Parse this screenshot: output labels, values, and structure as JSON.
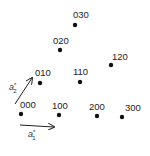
{
  "diagram": {
    "type": "reciprocal-lattice",
    "points": [
      {
        "label": "000",
        "x": 21,
        "y": 114,
        "lx": 20,
        "ly": 108
      },
      {
        "label": "100",
        "x": 59,
        "y": 115,
        "lx": 52,
        "ly": 109
      },
      {
        "label": "200",
        "x": 97,
        "y": 116,
        "lx": 89,
        "ly": 110
      },
      {
        "label": "300",
        "x": 122,
        "y": 117,
        "lx": 125,
        "ly": 111
      },
      {
        "label": "010",
        "x": 40,
        "y": 83,
        "lx": 35,
        "ly": 76
      },
      {
        "label": "110",
        "x": 80,
        "y": 82,
        "lx": 73,
        "ly": 75
      },
      {
        "label": "120",
        "x": 111,
        "y": 65,
        "lx": 112,
        "ly": 60
      },
      {
        "label": "020",
        "x": 60,
        "y": 50,
        "lx": 53,
        "ly": 44
      },
      {
        "label": "030",
        "x": 75,
        "y": 25,
        "lx": 73,
        "ly": 18
      }
    ],
    "vectors": [
      {
        "name": "a1-star",
        "label": "a",
        "sup": "*",
        "sub": "1",
        "x1": 20,
        "y1": 125,
        "x2": 54,
        "y2": 127,
        "lx": 28,
        "ly": 137
      },
      {
        "name": "a2-star",
        "label": "a",
        "sup": "*",
        "sub": "2",
        "x1": 15,
        "y1": 104,
        "x2": 32,
        "y2": 78,
        "lx": 9,
        "ly": 90
      }
    ],
    "colors": {
      "dot": "#111111",
      "text": "#222222",
      "arrow": "#222222"
    }
  }
}
